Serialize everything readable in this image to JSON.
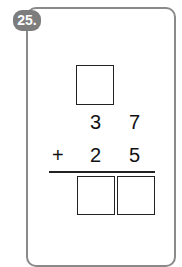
{
  "problem": {
    "number_label": "25.",
    "operator": "+",
    "top_number": {
      "tens": "3",
      "ones": "7"
    },
    "bottom_number": {
      "tens": "2",
      "ones": "5"
    },
    "carry_box_value": "",
    "answer_boxes": [
      "",
      ""
    ]
  }
}
